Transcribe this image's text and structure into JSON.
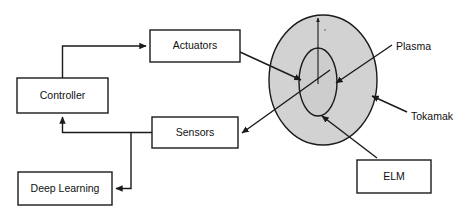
{
  "diagram": {
    "colors": {
      "vessel_fill": "#d2d2d2",
      "plasma_fill": "#cdcdcd",
      "stroke": "#1a1a1a",
      "background": "#ffffff",
      "text": "#111111"
    },
    "nodes": [
      {
        "id": "controller",
        "label": "Controller",
        "x": 17,
        "y": 78,
        "w": 91,
        "h": 35
      },
      {
        "id": "actuators",
        "label": "Actuators",
        "x": 150,
        "y": 30,
        "w": 90,
        "h": 32
      },
      {
        "id": "sensors",
        "label": "Sensors",
        "x": 152,
        "y": 117,
        "w": 86,
        "h": 31
      },
      {
        "id": "deep_learning",
        "label": "Deep Learning",
        "x": 18,
        "y": 172,
        "w": 94,
        "h": 33
      },
      {
        "id": "elm",
        "label": "ELM",
        "x": 357,
        "y": 160,
        "w": 74,
        "h": 33
      }
    ],
    "vessel": {
      "id": "tokamak",
      "cx": 323,
      "cy": 80,
      "rx": 54,
      "ry": 65
    },
    "plasma": {
      "id": "plasma",
      "cx": 318,
      "cy": 82,
      "rx": 19,
      "ry": 34
    },
    "axis": {
      "label": "z",
      "label_x": 324,
      "label_y": 28
    },
    "annotations": [
      {
        "id": "plasma-label",
        "label": "Plasma",
        "x": 396,
        "y": 47
      },
      {
        "id": "tokamak-label",
        "label": "Tokamak",
        "x": 411,
        "y": 117
      }
    ],
    "edges": [
      {
        "id": "controller-to-actuators",
        "from": "controller",
        "to": "actuators"
      },
      {
        "id": "actuators-to-plasma",
        "from": "actuators",
        "to": "plasma"
      },
      {
        "id": "plasma-to-sensors",
        "from": "plasma",
        "to": "sensors"
      },
      {
        "id": "sensors-to-controller",
        "from": "sensors",
        "to": "controller"
      },
      {
        "id": "sensors-to-deeplearning",
        "from": "sensors",
        "to": "deep_learning"
      },
      {
        "id": "elm-to-plasma",
        "from": "elm",
        "to": "plasma"
      }
    ]
  }
}
